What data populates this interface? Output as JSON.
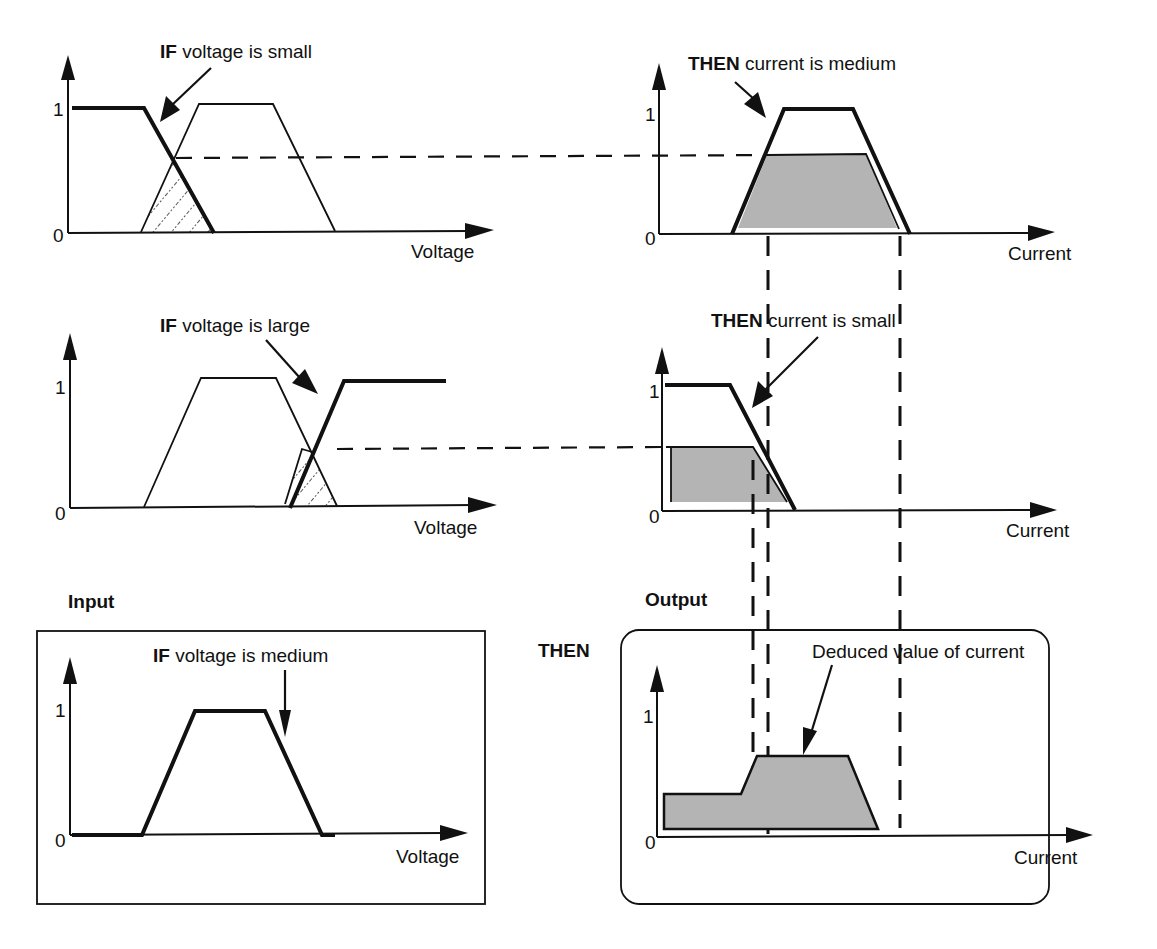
{
  "diagram": {
    "type": "fuzzy-inference",
    "panels": {
      "rule1_if": {
        "keyword": "IF",
        "label": " voltage is small",
        "axis_x": "Voltage",
        "tick_0": "0",
        "tick_1": "1"
      },
      "rule1_then": {
        "keyword": "THEN",
        "label": " current is medium",
        "axis_x": "Current",
        "tick_0": "0",
        "tick_1": "1"
      },
      "rule2_if": {
        "keyword": "IF",
        "label": " voltage is large",
        "axis_x": "Voltage",
        "tick_0": "0",
        "tick_1": "1"
      },
      "rule2_then": {
        "keyword": "THEN",
        "label": " current is small",
        "axis_x": "Current",
        "tick_0": "0",
        "tick_1": "1"
      },
      "input": {
        "title": "Input",
        "keyword": "IF",
        "label": " voltage is medium",
        "axis_x": "Voltage",
        "tick_0": "0",
        "tick_1": "1"
      },
      "output": {
        "title": "Output",
        "then_label": "THEN",
        "annotation": "Deduced value of current",
        "axis_x": "Current",
        "tick_0": "0",
        "tick_1": "1"
      }
    },
    "colors": {
      "line": "#111111",
      "shade": "#b4b4b4",
      "background": "#ffffff"
    }
  }
}
